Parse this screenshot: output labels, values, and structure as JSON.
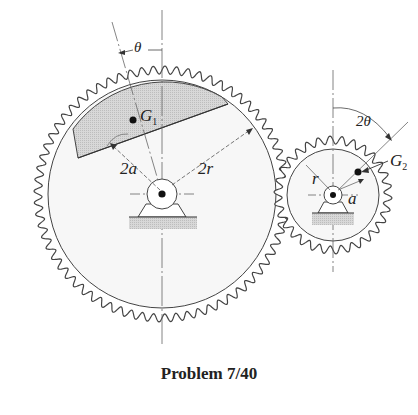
{
  "figure": {
    "caption": "Problem 7/40",
    "labels": {
      "theta": "θ",
      "two_theta": "2θ",
      "g1_main": "G",
      "g1_sub": "1",
      "g2_main": "G",
      "g2_sub": "2",
      "two_a": "2a",
      "two_r": "2r",
      "r": "r",
      "a": "a"
    },
    "colors": {
      "line": "#333333",
      "shade": "#e8e8e8",
      "background": "#ffffff"
    }
  }
}
